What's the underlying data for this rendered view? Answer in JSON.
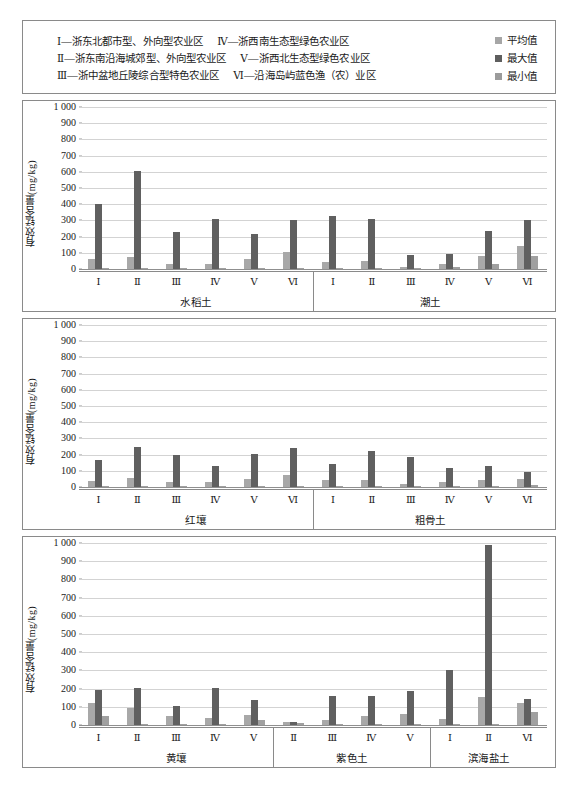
{
  "legend": {
    "regions_col_a": [
      "Ⅰ—浙东北都市型、外向型农业区",
      "Ⅱ—浙东南沿海城郊型、外向型农业区",
      "Ⅲ—浙中盆地丘陵综合型特色农业区"
    ],
    "regions_col_b": [
      "Ⅳ—浙西南生态型绿色农业区",
      "Ⅴ—浙西北生态型绿色农业区",
      "Ⅵ—沿海岛屿蓝色渔（农）业区"
    ],
    "series": [
      {
        "label": "平均值",
        "color": "#a8a8a8"
      },
      {
        "label": "最大值",
        "color": "#606060"
      },
      {
        "label": "最小值",
        "color": "#a0a0a0"
      }
    ]
  },
  "chart_data": [
    {
      "type": "bar",
      "title": "",
      "xlabel": "",
      "ylabel": "有效锰含量(mg/kg)",
      "ylim": [
        0,
        1000
      ],
      "yticks": [
        "0",
        "100",
        "200",
        "300",
        "400",
        "500",
        "600",
        "700",
        "800",
        "900",
        "1 000"
      ],
      "grid": true,
      "legend_position": "top-right",
      "groups": [
        {
          "name": "水稻土",
          "categories": [
            "Ⅰ",
            "Ⅱ",
            "Ⅲ",
            "Ⅳ",
            "Ⅴ",
            "Ⅵ"
          ],
          "series": [
            {
              "name": "平均值",
              "values": [
                60,
                72,
                28,
                30,
                64,
                103
              ]
            },
            {
              "name": "最大值",
              "values": [
                400,
                605,
                228,
                308,
                215,
                303
              ]
            },
            {
              "name": "最小值",
              "values": [
                2,
                2,
                2,
                2,
                2,
                4
              ]
            }
          ]
        },
        {
          "name": "潮土",
          "categories": [
            "Ⅰ",
            "Ⅱ",
            "Ⅲ",
            "Ⅳ",
            "Ⅴ",
            "Ⅵ"
          ],
          "series": [
            {
              "name": "平均值",
              "values": [
                45,
                48,
                14,
                32,
                82,
                140
              ]
            },
            {
              "name": "最大值",
              "values": [
                330,
                308,
                88,
                90,
                232,
                305
              ]
            },
            {
              "name": "最小值",
              "values": [
                2,
                8,
                2,
                10,
                28,
                80
              ]
            }
          ]
        }
      ]
    },
    {
      "type": "bar",
      "title": "",
      "xlabel": "",
      "ylabel": "有效锰含量(mg/kg)",
      "ylim": [
        0,
        1000
      ],
      "yticks": [
        "0",
        "100",
        "200",
        "300",
        "400",
        "500",
        "600",
        "700",
        "800",
        "900",
        "1 000"
      ],
      "grid": true,
      "legend_position": "top-right",
      "groups": [
        {
          "name": "红壤",
          "categories": [
            "Ⅰ",
            "Ⅱ",
            "Ⅲ",
            "Ⅳ",
            "Ⅴ",
            "Ⅵ"
          ],
          "series": [
            {
              "name": "平均值",
              "values": [
                40,
                58,
                32,
                30,
                48,
                72
              ]
            },
            {
              "name": "最大值",
              "values": [
                165,
                250,
                200,
                132,
                202,
                238
              ]
            },
            {
              "name": "最小值",
              "values": [
                2,
                2,
                2,
                2,
                2,
                2
              ]
            }
          ]
        },
        {
          "name": "粗骨土",
          "categories": [
            "Ⅰ",
            "Ⅱ",
            "Ⅲ",
            "Ⅳ",
            "Ⅴ",
            "Ⅵ"
          ],
          "series": [
            {
              "name": "平均值",
              "values": [
                42,
                45,
                20,
                30,
                45,
                52
              ]
            },
            {
              "name": "最大值",
              "values": [
                140,
                225,
                185,
                115,
                130,
                90
              ]
            },
            {
              "name": "最小值",
              "values": [
                4,
                4,
                2,
                2,
                6,
                14
              ]
            }
          ]
        }
      ]
    },
    {
      "type": "bar",
      "title": "",
      "xlabel": "",
      "ylabel": "有效锰含量(mg/kg)",
      "ylim": [
        0,
        1000
      ],
      "yticks": [
        "0",
        "100",
        "200",
        "300",
        "400",
        "500",
        "600",
        "700",
        "800",
        "900",
        "1 000"
      ],
      "grid": true,
      "legend_position": "top-right",
      "groups": [
        {
          "name": "黄壤",
          "categories": [
            "Ⅰ",
            "Ⅱ",
            "Ⅲ",
            "Ⅳ",
            "Ⅴ"
          ],
          "series": [
            {
              "name": "平均值",
              "values": [
                122,
                96,
                50,
                36,
                54
              ]
            },
            {
              "name": "最大值",
              "values": [
                195,
                205,
                105,
                202,
                140
              ]
            },
            {
              "name": "最小值",
              "values": [
                52,
                8,
                2,
                2,
                25
              ]
            }
          ]
        },
        {
          "name": "紫色土",
          "categories": [
            "Ⅱ",
            "Ⅲ",
            "Ⅳ",
            "Ⅴ"
          ],
          "series": [
            {
              "name": "平均值",
              "values": [
                14,
                30,
                48,
                60
              ]
            },
            {
              "name": "最大值",
              "values": [
                16,
                160,
                160,
                185
              ]
            },
            {
              "name": "最小值",
              "values": [
                12,
                2,
                6,
                4
              ]
            }
          ]
        },
        {
          "name": "滨海盐土",
          "categories": [
            "Ⅰ",
            "Ⅱ",
            "Ⅵ"
          ],
          "series": [
            {
              "name": "平均值",
              "values": [
                32,
                152,
                120
              ]
            },
            {
              "name": "最大值",
              "values": [
                302,
                990,
                142
              ]
            },
            {
              "name": "最小值",
              "values": [
                2,
                4,
                70
              ]
            }
          ]
        }
      ]
    }
  ]
}
